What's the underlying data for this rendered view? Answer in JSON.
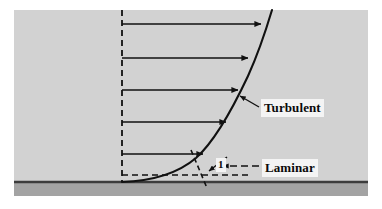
{
  "figure": {
    "labels": {
      "turbulent": "Turbulent",
      "laminar": "Laminar",
      "slope_unit": "1"
    },
    "colors": {
      "page_background": "#ffffff",
      "flow_field": "#d2d2d2",
      "wall_band": "#a3a3a3",
      "wall_line": "#3c3c3c",
      "ink": "#111111",
      "label_background": "#f4f4f4"
    },
    "geometry": {
      "field": {
        "x": 14,
        "y": 10,
        "width": 354,
        "height": 186
      },
      "wall_line_y": 182,
      "wall_band": {
        "y": 183,
        "height": 13
      },
      "reference_axis_x": 122,
      "curve_wall_point": {
        "x": 122,
        "y": 182
      },
      "curve_top_point": {
        "x": 272,
        "y": 10
      }
    },
    "velocity_arrows": [
      {
        "y": 24,
        "x_start": 122,
        "x_tip": 263
      },
      {
        "y": 58,
        "x_start": 122,
        "x_tip": 250
      },
      {
        "y": 90,
        "x_start": 122,
        "x_tip": 240
      },
      {
        "y": 122,
        "x_start": 122,
        "x_tip": 228
      },
      {
        "y": 154,
        "x_start": 122,
        "x_tip": 205
      }
    ],
    "tangent": {
      "horizontal_dashed": {
        "x_start": 122,
        "x_end": 252,
        "y": 175
      },
      "slope_dashed": {
        "x_start": 192,
        "y_start": 153,
        "x_end": 206,
        "y_end": 186
      }
    },
    "callouts": [
      {
        "name": "turbulent-pointer",
        "from_x": 258,
        "from_y": 107,
        "to_x": 239,
        "to_y": 96,
        "style": "solid"
      },
      {
        "name": "laminar-pointer",
        "from_x": 259,
        "from_y": 166,
        "to_x": 222,
        "to_y": 166,
        "style": "dashed"
      },
      {
        "name": "slope-pointer",
        "from_x": 226,
        "from_y": 158,
        "to_x": 208,
        "to_y": 172,
        "style": "solid"
      }
    ]
  }
}
